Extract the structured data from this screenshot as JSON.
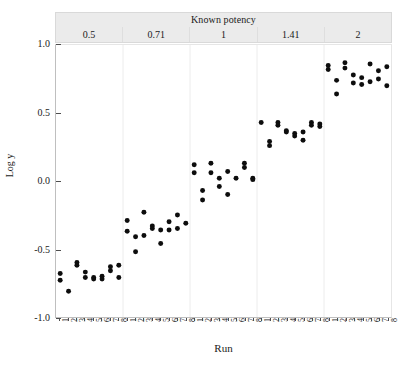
{
  "chart_data": {
    "type": "scatter",
    "title": "",
    "strip_title": "Known potency",
    "panels": [
      "0.5",
      "0.71",
      "1",
      "1.41",
      "2"
    ],
    "xlabel": "Run",
    "ylabel": "Log y",
    "ylim": [
      -1.0,
      1.0
    ],
    "ytick_labels": [
      "1.0",
      "0.5",
      "0.0",
      "-0.5",
      "-1.0"
    ],
    "ytick_values": [
      1.0,
      0.5,
      0.0,
      -0.5,
      -1.0
    ],
    "xtick_labels": [
      "1",
      "2",
      "3",
      "4",
      "5",
      "6",
      "7",
      "8"
    ],
    "xtick_values": [
      1,
      2,
      3,
      4,
      5,
      6,
      7,
      8
    ],
    "grid": false,
    "legend": "none",
    "marker": "filled-circle",
    "marker_color": "#0d0d0d",
    "groups": [
      {
        "potency": "0.5",
        "points": [
          {
            "run": 1,
            "values": [
              -0.68,
              -0.73
            ]
          },
          {
            "run": 2,
            "values": [
              -0.81
            ]
          },
          {
            "run": 3,
            "values": [
              -0.6,
              -0.62
            ]
          },
          {
            "run": 4,
            "values": [
              -0.67,
              -0.71
            ]
          },
          {
            "run": 5,
            "values": [
              -0.71,
              -0.72
            ]
          },
          {
            "run": 6,
            "values": [
              -0.7,
              -0.72
            ]
          },
          {
            "run": 7,
            "values": [
              -0.63,
              -0.66
            ]
          },
          {
            "run": 8,
            "values": [
              -0.62,
              -0.71
            ]
          }
        ]
      },
      {
        "potency": "0.71",
        "points": [
          {
            "run": 1,
            "values": [
              -0.29,
              -0.37
            ]
          },
          {
            "run": 2,
            "values": [
              -0.41,
              -0.52
            ]
          },
          {
            "run": 3,
            "values": [
              -0.23,
              -0.4
            ]
          },
          {
            "run": 4,
            "values": [
              -0.33,
              -0.35
            ]
          },
          {
            "run": 5,
            "values": [
              -0.36,
              -0.46
            ]
          },
          {
            "run": 6,
            "values": [
              -0.3,
              -0.36
            ]
          },
          {
            "run": 7,
            "values": [
              -0.25,
              -0.35
            ]
          },
          {
            "run": 8,
            "values": [
              -0.31
            ]
          }
        ]
      },
      {
        "potency": "1",
        "points": [
          {
            "run": 1,
            "values": [
              0.12,
              0.06
            ]
          },
          {
            "run": 2,
            "values": [
              -0.07,
              -0.14
            ]
          },
          {
            "run": 3,
            "values": [
              0.13,
              0.06
            ]
          },
          {
            "run": 4,
            "values": [
              0.02,
              -0.04
            ]
          },
          {
            "run": 5,
            "values": [
              0.07,
              -0.1
            ]
          },
          {
            "run": 6,
            "values": [
              0.02
            ]
          },
          {
            "run": 7,
            "values": [
              0.13,
              0.1
            ]
          },
          {
            "run": 8,
            "values": [
              0.02,
              0.01
            ]
          }
        ]
      },
      {
        "potency": "1.41",
        "points": [
          {
            "run": 1,
            "values": [
              0.43
            ]
          },
          {
            "run": 2,
            "values": [
              0.29,
              0.26
            ]
          },
          {
            "run": 3,
            "values": [
              0.43,
              0.41
            ]
          },
          {
            "run": 4,
            "values": [
              0.37,
              0.36
            ]
          },
          {
            "run": 5,
            "values": [
              0.35,
              0.33
            ]
          },
          {
            "run": 6,
            "values": [
              0.36,
              0.3
            ]
          },
          {
            "run": 7,
            "values": [
              0.43,
              0.41
            ]
          },
          {
            "run": 8,
            "values": [
              0.42,
              0.4
            ]
          }
        ]
      },
      {
        "potency": "2",
        "points": [
          {
            "run": 1,
            "values": [
              0.85,
              0.82
            ]
          },
          {
            "run": 2,
            "values": [
              0.74,
              0.64
            ]
          },
          {
            "run": 3,
            "values": [
              0.87,
              0.83
            ]
          },
          {
            "run": 4,
            "values": [
              0.78,
              0.72
            ]
          },
          {
            "run": 5,
            "values": [
              0.76,
              0.71
            ]
          },
          {
            "run": 6,
            "values": [
              0.86,
              0.73
            ]
          },
          {
            "run": 7,
            "values": [
              0.81,
              0.75
            ]
          },
          {
            "run": 8,
            "values": [
              0.84,
              0.7
            ]
          }
        ]
      }
    ]
  }
}
